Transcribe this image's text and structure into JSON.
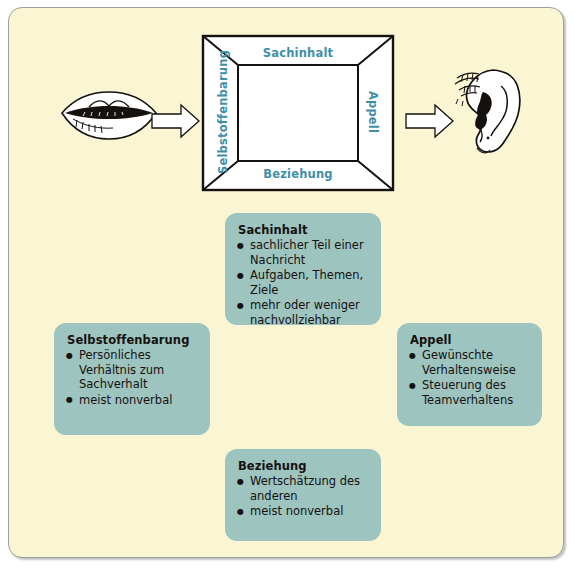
{
  "diagram": {
    "background_color": "#faf6d3",
    "box_color": "#9ec4c0",
    "label_color": "#3f8fa8"
  },
  "square": {
    "labels": {
      "top": "Sachinhalt",
      "bottom": "Beziehung",
      "left": "Selbstoffenbarung",
      "right": "Appell"
    }
  },
  "icons": {
    "sender": "mouth-illustration",
    "receiver": "ear-illustration",
    "arrow_left": "arrow-right-icon",
    "arrow_right": "arrow-right-icon"
  },
  "boxes": [
    {
      "id": "sachinhalt",
      "title": "Sachinhalt",
      "items": [
        "sachlicher Teil einer Nachricht",
        "Aufgaben, Themen, Ziele",
        "mehr oder weniger nachvollziehbar"
      ]
    },
    {
      "id": "selbstoffenbarung",
      "title": "Selbstoffenbarung",
      "items": [
        "Persönliches Verhältnis zum Sachverhalt",
        "meist nonverbal"
      ]
    },
    {
      "id": "appell",
      "title": "Appell",
      "items": [
        "Gewünschte Verhaltensweise",
        "Steuerung des Teamverhaltens"
      ]
    },
    {
      "id": "beziehung",
      "title": "Beziehung",
      "items": [
        "Wertschätzung des anderen",
        "meist nonverbal"
      ]
    }
  ]
}
